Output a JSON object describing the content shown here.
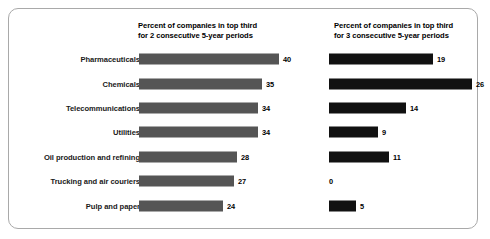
{
  "frame": {
    "border_color": "#a9a9a9",
    "background": "#ffffff"
  },
  "headers": {
    "left": "Percent of companies in top third\nfor 2 consecutive 5-year periods",
    "right": "Percent of companies in top third\nfor 3 consecutive 5-year periods"
  },
  "chart_data": {
    "type": "bar",
    "orientation": "horizontal",
    "title": "",
    "xlabel": "",
    "ylabel": "",
    "grid": false,
    "legend": "none",
    "categories": [
      "Pharmaceuticals",
      "Chemicals",
      "Telecommunications",
      "Utilities",
      "Oil production and refining",
      "Trucking and air couriers",
      "Pulp and paper"
    ],
    "series": [
      {
        "name": "Percent of companies in top third for 2 consecutive 5-year periods",
        "color": "#555555",
        "values": [
          40,
          35,
          34,
          34,
          28,
          27,
          24
        ],
        "xlim": [
          0,
          40
        ]
      },
      {
        "name": "Percent of companies in top third for 3 consecutive 5-year periods",
        "color": "#111111",
        "values": [
          19,
          26,
          14,
          9,
          11,
          0,
          5
        ],
        "xlim": [
          0,
          26
        ]
      }
    ]
  },
  "rows": [
    {
      "label": "Pharmaceuticals",
      "left_value": "40",
      "left_width": 140,
      "right_value": "19",
      "right_width": 104
    },
    {
      "label": "Chemicals",
      "left_value": "35",
      "left_width": 123,
      "right_value": "26",
      "right_width": 143
    },
    {
      "label": "Telecommunications",
      "left_value": "34",
      "left_width": 119,
      "right_value": "14",
      "right_width": 77
    },
    {
      "label": "Utilities",
      "left_value": "34",
      "left_width": 119,
      "right_value": "9",
      "right_width": 49
    },
    {
      "label": "Oil production and refining",
      "left_value": "28",
      "left_width": 98,
      "right_value": "11",
      "right_width": 60
    },
    {
      "label": "Trucking and air couriers",
      "left_value": "27",
      "left_width": 95,
      "right_value": "0",
      "right_width": 0
    },
    {
      "label": "Pulp and paper",
      "left_value": "24",
      "left_width": 84,
      "right_value": "5",
      "right_width": 27
    }
  ]
}
